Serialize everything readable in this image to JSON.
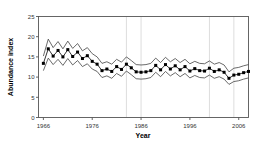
{
  "figure": {
    "background": "#ffffff",
    "frame_color": "#555555",
    "gridline_color": "#dddddd",
    "series_color": "#000000",
    "band_color": "#444444"
  },
  "chart_data": {
    "type": "line",
    "title": "",
    "xlabel": "Year",
    "ylabel": "Abundance index",
    "xlim": [
      1965,
      2008
    ],
    "ylim": [
      0,
      25
    ],
    "xticks": [
      1966,
      1976,
      1986,
      1996,
      2006
    ],
    "xtick_labels": [
      "1966",
      "1976",
      "1986",
      "1996",
      "2006"
    ],
    "yticks": [
      0,
      5,
      10,
      15,
      20,
      25
    ],
    "ytick_labels": [
      "0",
      "5",
      "10",
      "15",
      "20",
      "25"
    ],
    "grid": "vertical-only",
    "gridline_x": [
      1983,
      1986,
      2000,
      2005
    ],
    "legend": "none",
    "marker": "filled-square",
    "x": [
      1966,
      1967,
      1968,
      1969,
      1970,
      1971,
      1972,
      1973,
      1974,
      1975,
      1976,
      1977,
      1978,
      1979,
      1980,
      1981,
      1982,
      1983,
      1984,
      1985,
      1986,
      1987,
      1988,
      1989,
      1990,
      1991,
      1992,
      1993,
      1994,
      1995,
      1996,
      1997,
      1998,
      1999,
      2000,
      2001,
      2002,
      2003,
      2004,
      2005,
      2006,
      2007,
      2008
    ],
    "series": [
      {
        "name": "Abundance index",
        "values": [
          13.4,
          17.0,
          15.2,
          16.6,
          15.0,
          16.8,
          15.1,
          16.2,
          14.6,
          15.3,
          13.9,
          13.2,
          11.6,
          12.0,
          11.4,
          12.6,
          11.9,
          13.2,
          12.3,
          11.3,
          11.2,
          11.3,
          11.6,
          12.9,
          11.8,
          13.1,
          12.0,
          12.8,
          11.8,
          12.6,
          11.5,
          12.1,
          11.6,
          11.5,
          12.2,
          11.4,
          11.8,
          11.2,
          9.7,
          10.5,
          10.7,
          11.1,
          11.4
        ]
      },
      {
        "name": "Upper confidence limit",
        "values": [
          15.2,
          19.4,
          17.3,
          18.8,
          17.0,
          18.9,
          17.1,
          18.3,
          16.5,
          17.3,
          15.8,
          15.0,
          13.4,
          13.8,
          13.2,
          14.4,
          13.7,
          15.0,
          14.1,
          13.1,
          13.0,
          13.1,
          13.4,
          14.7,
          13.6,
          14.9,
          13.8,
          14.6,
          13.6,
          14.4,
          13.3,
          13.9,
          13.4,
          13.3,
          14.0,
          13.2,
          13.6,
          13.0,
          11.3,
          12.2,
          12.4,
          12.8,
          13.1
        ]
      },
      {
        "name": "Lower confidence limit",
        "values": [
          11.6,
          14.7,
          13.1,
          14.4,
          12.9,
          14.6,
          13.0,
          14.1,
          12.6,
          13.3,
          12.0,
          11.4,
          9.9,
          10.3,
          9.7,
          10.9,
          10.2,
          11.5,
          10.6,
          9.6,
          9.5,
          9.6,
          9.9,
          11.2,
          10.1,
          11.4,
          10.3,
          11.1,
          10.1,
          10.9,
          9.8,
          10.4,
          9.9,
          9.8,
          10.5,
          9.7,
          10.1,
          9.5,
          8.2,
          8.9,
          9.1,
          9.5,
          9.8
        ]
      }
    ]
  }
}
